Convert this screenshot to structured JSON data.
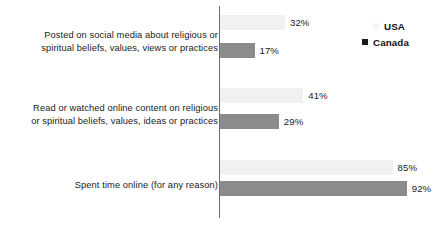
{
  "chart_data": {
    "type": "bar",
    "orientation": "horizontal",
    "title": "",
    "xlabel": "",
    "ylabel": "",
    "xlim": [
      0,
      100
    ],
    "grid": false,
    "legend_position": "top-right",
    "categories": [
      "Posted on social media about religious or spiritual beliefs, values, views or practices",
      "Read or watched online content on religious or spiritual beliefs, values, ideas or practices",
      "Spent time online (for any reason)"
    ],
    "category_lines": [
      [
        "Posted on social media about religious or",
        "spiritual beliefs, values, views or practices"
      ],
      [
        "Read or watched online content on religious",
        "or spiritual beliefs, values, ideas or practices"
      ],
      [
        "Spent time online (for any reason)"
      ]
    ],
    "series": [
      {
        "name": "USA",
        "color": "#f1f1f1",
        "values": [
          32,
          41,
          85
        ],
        "value_labels": [
          "32%",
          "41%",
          "85%"
        ]
      },
      {
        "name": "Canada",
        "color": "#8b8b8b",
        "values": [
          17,
          29,
          92
        ],
        "value_labels": [
          "17%",
          "29%",
          "92%"
        ]
      }
    ]
  },
  "legend": {
    "items": [
      {
        "label": "USA",
        "color": "#f6f6f6"
      },
      {
        "label": "Canada",
        "color": "#1a1a1a"
      }
    ]
  },
  "axis": {
    "baseline_color": "#6f6f6f"
  }
}
